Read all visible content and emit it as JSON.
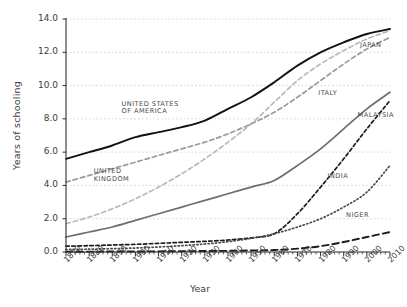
{
  "chart_data": {
    "type": "line",
    "title": "",
    "xlabel": "Year",
    "ylabel": "Years of schooling",
    "xlim": [
      1870,
      2010
    ],
    "ylim": [
      0.0,
      14.0
    ],
    "grid": true,
    "legend_position": "inline-labels",
    "x": [
      1870,
      1880,
      1890,
      1900,
      1910,
      1920,
      1930,
      1940,
      1950,
      1960,
      1970,
      1980,
      1990,
      2000,
      2010
    ],
    "yticks": [
      "0.0",
      "2.0",
      "4.0",
      "6.0",
      "8.0",
      "10.0",
      "12.0",
      "14.0"
    ],
    "xticks": [
      "1870",
      "1880",
      "1890",
      "1900",
      "1910",
      "1920",
      "1930",
      "1940",
      "1950",
      "1960",
      "1970",
      "1980",
      "1990",
      "2000",
      "2010"
    ],
    "series": [
      {
        "name": "UNITED STATES OF AMERICA",
        "label": "UNITED STATES\nOF AMERICA",
        "style": "solid",
        "color": "#111111",
        "width": 1.9,
        "values": [
          5.6,
          6.0,
          6.4,
          6.9,
          7.2,
          7.5,
          7.9,
          8.6,
          9.3,
          10.2,
          11.2,
          12.0,
          12.6,
          13.1,
          13.4
        ]
      },
      {
        "name": "JAPAN",
        "label": "JAPAN",
        "style": "dashed-light",
        "color": "#b9b9b9",
        "width": 1.7,
        "values": [
          1.7,
          2.1,
          2.6,
          3.2,
          3.9,
          4.7,
          5.6,
          6.6,
          7.7,
          9.0,
          10.3,
          11.3,
          12.1,
          12.8,
          13.3
        ]
      },
      {
        "name": "UNITED KINGDOM",
        "label": "UNITED\nKINGDOM",
        "style": "dashed-gray",
        "color": "#9a9a9a",
        "width": 1.7,
        "values": [
          4.2,
          4.6,
          5.0,
          5.4,
          5.8,
          6.2,
          6.6,
          7.1,
          7.7,
          8.4,
          9.3,
          10.3,
          11.3,
          12.2,
          12.9
        ]
      },
      {
        "name": "ITALY",
        "label": "ITALY",
        "style": "solid",
        "color": "#6e6e6e",
        "width": 1.7,
        "values": [
          0.9,
          1.2,
          1.5,
          1.9,
          2.3,
          2.7,
          3.1,
          3.5,
          3.9,
          4.3,
          5.2,
          6.2,
          7.4,
          8.6,
          9.6
        ]
      },
      {
        "name": "MALAYSIA",
        "label": "MALAYSIA",
        "style": "dashed",
        "color": "#1c1c1c",
        "width": 1.7,
        "values": [
          0.35,
          0.38,
          0.42,
          0.46,
          0.52,
          0.58,
          0.64,
          0.72,
          0.85,
          1.1,
          2.3,
          3.9,
          5.6,
          7.4,
          9.1
        ]
      },
      {
        "name": "INDIA",
        "label": "INDIA",
        "style": "dotted",
        "color": "#4a4a4a",
        "width": 1.7,
        "values": [
          0.15,
          0.17,
          0.2,
          0.24,
          0.3,
          0.38,
          0.48,
          0.62,
          0.82,
          1.1,
          1.5,
          2.0,
          2.7,
          3.6,
          5.2
        ]
      },
      {
        "name": "NIGER",
        "label": "NIGER",
        "style": "dashed-long",
        "color": "#1c1c1c",
        "width": 1.9,
        "values": [
          0.02,
          0.02,
          0.03,
          0.03,
          0.04,
          0.05,
          0.06,
          0.07,
          0.09,
          0.12,
          0.2,
          0.35,
          0.6,
          0.9,
          1.2
        ]
      }
    ],
    "annotations": [
      {
        "text": "UNITED STATES",
        "x": 1894,
        "y": 8.9
      },
      {
        "text": "OF AMERICA",
        "x": 1894,
        "y": 8.45
      },
      {
        "text": "UNITED",
        "x": 1882,
        "y": 4.85
      },
      {
        "text": "KINGDOM",
        "x": 1882,
        "y": 4.4
      },
      {
        "text": "JAPAN",
        "x": 1997,
        "y": 12.45
      },
      {
        "text": "ITALY",
        "x": 1979,
        "y": 9.55
      },
      {
        "text": "MALAYSIA",
        "x": 1996,
        "y": 8.25
      },
      {
        "text": "INDIA",
        "x": 1983,
        "y": 4.55
      },
      {
        "text": "NIGER",
        "x": 1991,
        "y": 2.25
      }
    ],
    "caption": ""
  },
  "axis": {
    "ylabel": "Years of schooling",
    "xlabel": "Year"
  }
}
